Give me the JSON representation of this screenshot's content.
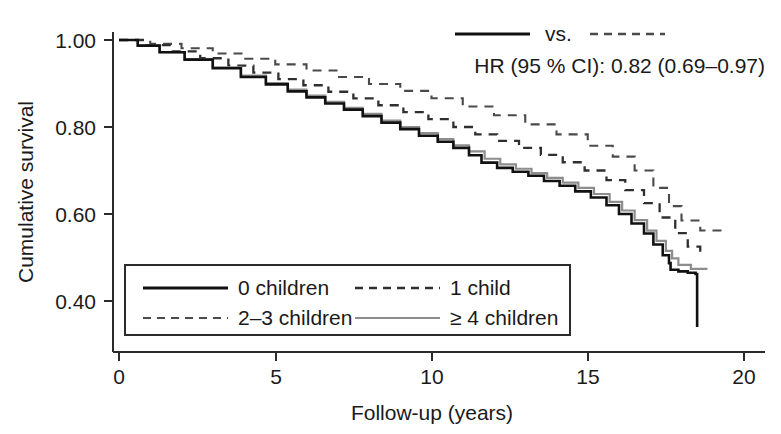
{
  "chart_data": {
    "type": "line",
    "title": "",
    "subtitle": "",
    "xlabel": "Follow-up (years)",
    "ylabel": "Cumulative survival",
    "xlim": [
      0,
      20
    ],
    "ylim": [
      0.32,
      1.02
    ],
    "xticks": [
      0,
      5,
      10,
      15,
      20
    ],
    "xtick_labels": [
      "0",
      "5",
      "10",
      "15",
      "20"
    ],
    "yticks": [
      1.0,
      0.8,
      0.6,
      0.4
    ],
    "ytick_labels": [
      "1.00",
      "0.80",
      "0.60",
      "0.40"
    ],
    "grid": false,
    "legend_position": "lower-left-inside",
    "annotation": {
      "comparison_label": "vs.",
      "hr_text": "HR (95 % CI): 0.82 (0.69–0.97)",
      "solid_series": "0 children",
      "dashed_series": "2–3 children"
    },
    "series": [
      {
        "name": "0 children",
        "style": "solid",
        "color": "#111111",
        "x": [
          0,
          0.6,
          1.3,
          2.1,
          3.0,
          3.9,
          4.7,
          5.4,
          6.0,
          6.6,
          7.2,
          7.8,
          8.4,
          9.0,
          9.6,
          10.2,
          10.7,
          11.2,
          11.6,
          12.1,
          12.6,
          13.1,
          13.6,
          14.1,
          14.6,
          15.1,
          15.6,
          16.0,
          16.4,
          16.8,
          17.1,
          17.4,
          17.6,
          17.65,
          17.9,
          18.2,
          18.45,
          18.5
        ],
        "y": [
          1.0,
          0.987,
          0.972,
          0.955,
          0.935,
          0.915,
          0.898,
          0.882,
          0.868,
          0.854,
          0.84,
          0.825,
          0.81,
          0.795,
          0.78,
          0.766,
          0.752,
          0.735,
          0.718,
          0.706,
          0.697,
          0.688,
          0.676,
          0.665,
          0.652,
          0.638,
          0.62,
          0.6,
          0.578,
          0.555,
          0.53,
          0.505,
          0.487,
          0.472,
          0.468,
          0.465,
          0.462,
          0.34
        ]
      },
      {
        "name": "1 child",
        "style": "dashed",
        "color": "#2f2f2f",
        "x": [
          0,
          0.8,
          1.7,
          2.6,
          3.5,
          4.3,
          5.1,
          5.9,
          6.7,
          7.5,
          8.3,
          9.1,
          9.9,
          10.7,
          11.4,
          12.1,
          12.8,
          13.5,
          14.2,
          14.9,
          15.6,
          16.2,
          16.8,
          17.3,
          17.8,
          18.2,
          18.6
        ],
        "y": [
          1.0,
          0.988,
          0.974,
          0.958,
          0.941,
          0.925,
          0.91,
          0.896,
          0.881,
          0.866,
          0.85,
          0.834,
          0.818,
          0.8,
          0.783,
          0.768,
          0.752,
          0.736,
          0.719,
          0.7,
          0.678,
          0.655,
          0.625,
          0.592,
          0.556,
          0.525,
          0.512
        ]
      },
      {
        "name": "2–3 children",
        "style": "dashed",
        "color": "#4a4a4a",
        "x": [
          0,
          1.0,
          2.0,
          3.0,
          4.0,
          5.0,
          6.0,
          7.0,
          8.0,
          9.0,
          10.0,
          11.0,
          12.0,
          13.0,
          14.0,
          15.0,
          15.8,
          16.5,
          17.1,
          17.6,
          18.0,
          18.6,
          19.3
        ],
        "y": [
          1.0,
          0.991,
          0.981,
          0.969,
          0.957,
          0.944,
          0.93,
          0.915,
          0.899,
          0.883,
          0.866,
          0.847,
          0.827,
          0.806,
          0.783,
          0.757,
          0.732,
          0.7,
          0.66,
          0.618,
          0.585,
          0.562,
          0.56
        ]
      },
      {
        "name": "≥ 4 children",
        "style": "solid",
        "color": "#8d8d8d",
        "x": [
          0,
          0.6,
          1.3,
          2.1,
          3.0,
          3.9,
          4.7,
          5.4,
          6.0,
          6.6,
          7.2,
          7.8,
          8.4,
          9.0,
          9.6,
          10.2,
          10.7,
          11.2,
          11.7,
          12.2,
          12.7,
          13.2,
          13.7,
          14.2,
          14.7,
          15.2,
          15.7,
          16.1,
          16.5,
          16.9,
          17.2,
          17.5,
          17.7,
          17.9,
          18.3,
          18.8
        ],
        "y": [
          1.0,
          0.987,
          0.972,
          0.956,
          0.937,
          0.918,
          0.901,
          0.886,
          0.872,
          0.858,
          0.844,
          0.83,
          0.815,
          0.8,
          0.786,
          0.772,
          0.758,
          0.744,
          0.727,
          0.714,
          0.704,
          0.694,
          0.683,
          0.672,
          0.66,
          0.646,
          0.628,
          0.608,
          0.586,
          0.562,
          0.538,
          0.515,
          0.498,
          0.483,
          0.474,
          0.472
        ]
      }
    ]
  },
  "legend": {
    "entries": [
      {
        "label": "0 children",
        "style": "solid",
        "color": "#111111",
        "width": 3.0
      },
      {
        "label": "1 child",
        "style": "dashed",
        "color": "#2f2f2f",
        "width": 2.4
      },
      {
        "label": "2–3 children",
        "style": "dashed",
        "color": "#4a4a4a",
        "width": 2.2
      },
      {
        "label": "≥ 4 children",
        "style": "solid",
        "color": "#8d8d8d",
        "width": 2.2
      }
    ]
  },
  "axes": {
    "y_title": "Cumulative survival",
    "x_title": "Follow-up (years)",
    "y_tick_labels": [
      "1.00",
      "0.80",
      "0.60",
      "0.40"
    ],
    "x_tick_labels": [
      "0",
      "5",
      "10",
      "15",
      "20"
    ]
  },
  "annotation": {
    "vs_label": "vs.",
    "hr_line": "HR (95 % CI): 0.82 (0.69–0.97)"
  }
}
